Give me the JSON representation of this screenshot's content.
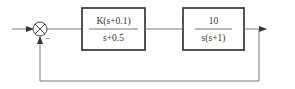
{
  "diagram": {
    "type": "feedback-control-block-diagram",
    "summing_junction": {
      "feedback_sign": "−"
    },
    "blocks": [
      {
        "id": "controller",
        "numerator": "K(s+0.1)",
        "denominator": "s+0.5"
      },
      {
        "id": "plant",
        "numerator": "10",
        "denominator": "s(s+1)"
      }
    ],
    "feedback": "unity"
  },
  "colors": {
    "line": "#7a7a7a",
    "box_border": "#2a2a2a",
    "text": "#333333",
    "background": "#ffffff"
  }
}
